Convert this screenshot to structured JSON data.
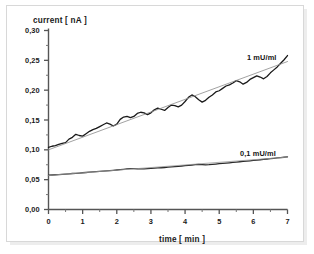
{
  "chart_data": {
    "type": "line",
    "title": "",
    "xlabel": "time [ min ]",
    "ylabel": "current [ nA ]",
    "xlim": [
      0,
      7
    ],
    "ylim": [
      0.0,
      0.3
    ],
    "grid": false,
    "legend_position": "inline-annotation",
    "xticks": [
      0,
      1,
      2,
      3,
      4,
      5,
      6,
      7
    ],
    "xtick_labels": [
      "0",
      "1",
      "2",
      "3",
      "4",
      "5",
      "6",
      "7"
    ],
    "xminor_step": 0.5,
    "yticks": [
      0.0,
      0.05,
      0.1,
      0.15,
      0.2,
      0.25,
      0.3
    ],
    "ytick_labels": [
      "0,00",
      "0,05",
      "0,10",
      "0,15",
      "0,20",
      "0,25",
      "0,30"
    ],
    "yminor_step": 0.025,
    "annotations": [
      {
        "text": "1 mU/ml",
        "x": 5.9,
        "y": 0.245
      },
      {
        "text": "0,1 mU/ml",
        "x": 5.55,
        "y": 0.107
      }
    ],
    "series": [
      {
        "name": "1 mU/ml",
        "style": "noisy-line",
        "color": "#1a1a1a",
        "x": [
          0.0,
          0.1,
          0.2,
          0.3,
          0.4,
          0.5,
          0.6,
          0.7,
          0.8,
          0.9,
          1.0,
          1.1,
          1.2,
          1.3,
          1.4,
          1.5,
          1.6,
          1.7,
          1.8,
          1.9,
          2.0,
          2.1,
          2.2,
          2.3,
          2.4,
          2.5,
          2.6,
          2.7,
          2.8,
          2.9,
          3.0,
          3.1,
          3.2,
          3.3,
          3.4,
          3.5,
          3.6,
          3.7,
          3.8,
          3.9,
          4.0,
          4.1,
          4.2,
          4.3,
          4.4,
          4.5,
          4.6,
          4.7,
          4.8,
          4.9,
          5.0,
          5.1,
          5.2,
          5.3,
          5.4,
          5.5,
          5.6,
          5.7,
          5.8,
          5.9,
          6.0,
          6.1,
          6.2,
          6.3,
          6.4,
          6.5,
          6.6,
          6.7,
          6.8,
          6.9,
          7.0
        ],
        "y": [
          0.104,
          0.106,
          0.107,
          0.109,
          0.111,
          0.112,
          0.118,
          0.121,
          0.126,
          0.124,
          0.123,
          0.127,
          0.131,
          0.134,
          0.136,
          0.139,
          0.142,
          0.145,
          0.143,
          0.14,
          0.143,
          0.151,
          0.155,
          0.156,
          0.154,
          0.156,
          0.161,
          0.163,
          0.162,
          0.159,
          0.162,
          0.167,
          0.17,
          0.168,
          0.166,
          0.171,
          0.175,
          0.174,
          0.172,
          0.175,
          0.181,
          0.188,
          0.192,
          0.189,
          0.184,
          0.18,
          0.183,
          0.188,
          0.192,
          0.197,
          0.199,
          0.203,
          0.207,
          0.209,
          0.212,
          0.216,
          0.214,
          0.21,
          0.213,
          0.218,
          0.221,
          0.224,
          0.222,
          0.219,
          0.223,
          0.229,
          0.234,
          0.239,
          0.245,
          0.251,
          0.258
        ]
      },
      {
        "name": "1 mU/ml trend",
        "style": "regression-line",
        "color": "#8a8a8a",
        "x": [
          0,
          7
        ],
        "y": [
          0.1,
          0.248
        ]
      },
      {
        "name": "0,1 mU/ml",
        "style": "noisy-line",
        "color": "#2a2a2a",
        "x": [
          0.0,
          0.1,
          0.2,
          0.3,
          0.4,
          0.5,
          0.6,
          0.7,
          0.8,
          0.9,
          1.0,
          1.1,
          1.2,
          1.3,
          1.4,
          1.5,
          1.6,
          1.7,
          1.8,
          1.9,
          2.0,
          2.1,
          2.2,
          2.3,
          2.4,
          2.5,
          2.6,
          2.7,
          2.8,
          2.9,
          3.0,
          3.1,
          3.2,
          3.3,
          3.4,
          3.5,
          3.6,
          3.7,
          3.8,
          3.9,
          4.0,
          4.1,
          4.2,
          4.3,
          4.4,
          4.5,
          4.6,
          4.7,
          4.8,
          4.9,
          5.0,
          5.1,
          5.2,
          5.3,
          5.4,
          5.5,
          5.6,
          5.7,
          5.8,
          5.9,
          6.0,
          6.1,
          6.2,
          6.3,
          6.4,
          6.5,
          6.6,
          6.7,
          6.8,
          6.9,
          7.0
        ],
        "y": [
          0.0575,
          0.0578,
          0.0582,
          0.0586,
          0.059,
          0.0594,
          0.0598,
          0.0603,
          0.0607,
          0.0611,
          0.0616,
          0.062,
          0.0625,
          0.0629,
          0.0634,
          0.0638,
          0.0643,
          0.0648,
          0.0652,
          0.0657,
          0.0662,
          0.0668,
          0.0674,
          0.068,
          0.0684,
          0.0686,
          0.0683,
          0.068,
          0.0682,
          0.0686,
          0.069,
          0.0694,
          0.0697,
          0.07,
          0.0704,
          0.0709,
          0.0714,
          0.0719,
          0.0724,
          0.0729,
          0.0734,
          0.074,
          0.0746,
          0.0751,
          0.0754,
          0.0752,
          0.0749,
          0.0751,
          0.0756,
          0.0762,
          0.0768,
          0.0773,
          0.0778,
          0.0783,
          0.0789,
          0.0794,
          0.08,
          0.0805,
          0.081,
          0.0816,
          0.0822,
          0.0828,
          0.0834,
          0.084,
          0.0846,
          0.0852,
          0.0858,
          0.0864,
          0.087,
          0.0876,
          0.0882
        ]
      },
      {
        "name": "0,1 mU/ml trend",
        "style": "regression-line",
        "color": "#9a9a9a",
        "x": [
          0,
          7
        ],
        "y": [
          0.0572,
          0.0878
        ]
      }
    ]
  }
}
